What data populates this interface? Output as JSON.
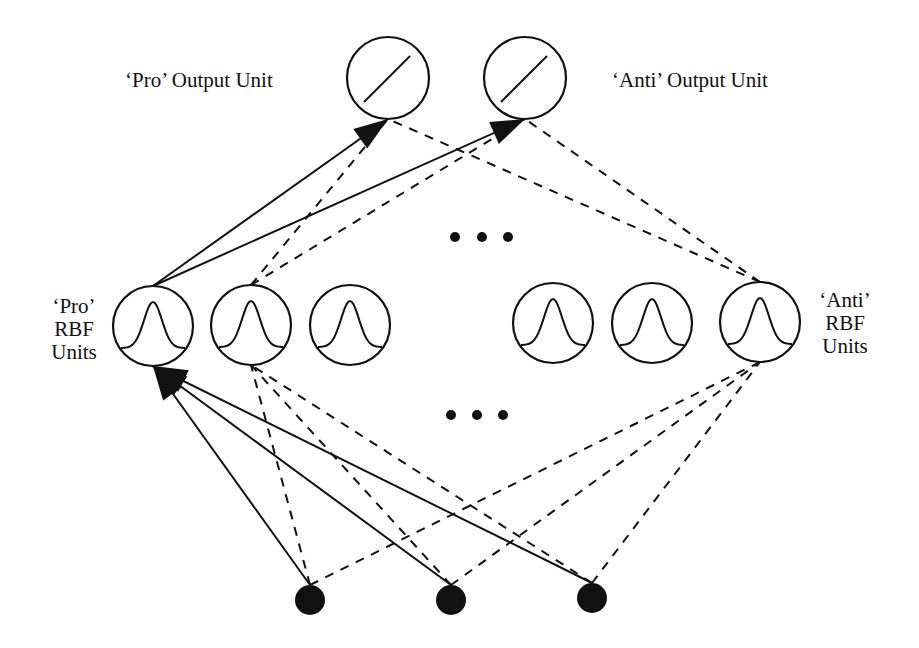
{
  "labels": {
    "pro_output": "‘Pro’ Output Unit",
    "anti_output": "‘Anti’ Output Unit",
    "pro_rbf": [
      "‘Pro’",
      "RBF",
      "Units"
    ],
    "anti_rbf": [
      "‘Anti’",
      "RBF",
      "Units"
    ]
  },
  "nodes": {
    "outputs": [
      {
        "id": "out-pro",
        "kind": "linear",
        "name": "Pro output unit"
      },
      {
        "id": "out-anti",
        "kind": "linear",
        "name": "Anti output unit"
      }
    ],
    "rbf": [
      {
        "id": "rbf-1",
        "kind": "gaussian",
        "group": "pro"
      },
      {
        "id": "rbf-2",
        "kind": "gaussian",
        "group": "pro"
      },
      {
        "id": "rbf-3",
        "kind": "gaussian",
        "group": "pro"
      },
      {
        "id": "rbf-4",
        "kind": "gaussian",
        "group": "anti"
      },
      {
        "id": "rbf-5",
        "kind": "gaussian",
        "group": "anti"
      },
      {
        "id": "rbf-6",
        "kind": "gaussian",
        "group": "anti"
      }
    ],
    "inputs": [
      {
        "id": "in-1"
      },
      {
        "id": "in-2"
      },
      {
        "id": "in-3"
      }
    ],
    "ellipsis_rows": [
      "between-rbf-and-output",
      "between-input-and-rbf"
    ]
  },
  "edges": [
    {
      "from": "rbf-1",
      "to": "out-pro",
      "style": "solid",
      "arrow": true
    },
    {
      "from": "rbf-1",
      "to": "out-anti",
      "style": "solid",
      "arrow": true
    },
    {
      "from": "rbf-2",
      "to": "out-pro",
      "style": "dashed",
      "arrow": false
    },
    {
      "from": "rbf-2",
      "to": "out-anti",
      "style": "dashed",
      "arrow": false
    },
    {
      "from": "rbf-6",
      "to": "out-pro",
      "style": "dashed",
      "arrow": false
    },
    {
      "from": "rbf-6",
      "to": "out-anti",
      "style": "dashed",
      "arrow": false
    },
    {
      "from": "in-1",
      "to": "rbf-1",
      "style": "solid",
      "arrow": true
    },
    {
      "from": "in-2",
      "to": "rbf-1",
      "style": "solid",
      "arrow": true
    },
    {
      "from": "in-3",
      "to": "rbf-1",
      "style": "solid",
      "arrow": true
    },
    {
      "from": "in-1",
      "to": "rbf-2",
      "style": "dashed",
      "arrow": false
    },
    {
      "from": "in-2",
      "to": "rbf-2",
      "style": "dashed",
      "arrow": false
    },
    {
      "from": "in-3",
      "to": "rbf-2",
      "style": "dashed",
      "arrow": false
    },
    {
      "from": "in-1",
      "to": "rbf-6",
      "style": "dashed",
      "arrow": false
    },
    {
      "from": "in-2",
      "to": "rbf-6",
      "style": "dashed",
      "arrow": false
    },
    {
      "from": "in-3",
      "to": "rbf-6",
      "style": "dashed",
      "arrow": false
    }
  ]
}
